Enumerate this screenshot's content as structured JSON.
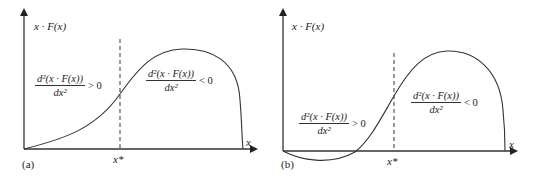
{
  "panels": [
    {
      "id": "a",
      "label": "(a)",
      "y_axis_label": "x · F(x)",
      "x_axis_label": "x",
      "x_star_label": "x*",
      "left_region": {
        "numerator": "d²(x · F(x))",
        "denominator": "dx²",
        "inequality": "> 0"
      },
      "right_region": {
        "numerator": "d²(x · F(x))",
        "denominator": "dx²",
        "inequality": "< 0"
      }
    },
    {
      "id": "b",
      "label": "(b)",
      "y_axis_label": "x · F(x)",
      "x_axis_label": "x",
      "x_star_label": "x*",
      "left_region": {
        "numerator": "d²(x · F(x))",
        "denominator": "dx²",
        "inequality": "> 0"
      },
      "right_region": {
        "numerator": "d²(x · F(x))",
        "denominator": "dx²",
        "inequality": "< 0"
      }
    }
  ],
  "colors": {
    "line": "#333333",
    "background": "#ffffff"
  }
}
